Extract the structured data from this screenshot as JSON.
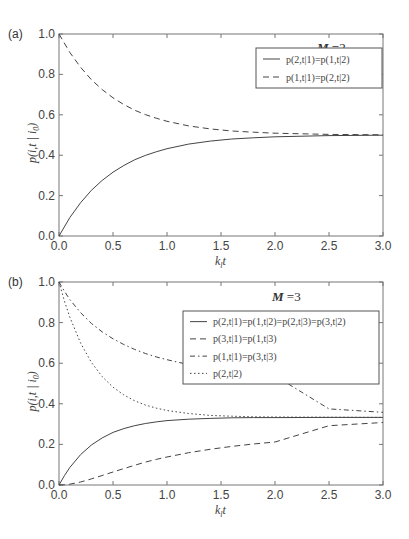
{
  "chart_data": [
    {
      "panel_label": "(a)",
      "type": "line",
      "annotation": "M =2",
      "annotation_bold": "M",
      "annotation_value": " =2",
      "xlabel": "k_l t",
      "ylabel": "p(i,t | i_0)",
      "xlim": [
        0,
        3.0
      ],
      "ylim": [
        0,
        1.0
      ],
      "xticks": [
        "0.0",
        "0.5",
        "1.0",
        "1.5",
        "2.0",
        "2.5",
        "3.0"
      ],
      "yticks": [
        "0.0",
        "0.2",
        "0.4",
        "0.6",
        "0.8",
        "1.0"
      ],
      "grid": false,
      "legend_position": "upper right",
      "x": [
        0,
        0.1,
        0.2,
        0.3,
        0.4,
        0.5,
        0.6,
        0.7,
        0.8,
        0.9,
        1.0,
        1.2,
        1.4,
        1.6,
        1.8,
        2.0,
        2.5,
        3.0
      ],
      "series": [
        {
          "name": "p(2,t|1)=p(1,t|2)",
          "style": "solid",
          "values": [
            0,
            0.091,
            0.165,
            0.226,
            0.275,
            0.316,
            0.349,
            0.377,
            0.399,
            0.417,
            0.432,
            0.455,
            0.47,
            0.48,
            0.486,
            0.491,
            0.497,
            0.499
          ]
        },
        {
          "name": "p(1,t|1)=p(2,t|2)",
          "style": "dashed",
          "values": [
            1,
            0.909,
            0.835,
            0.774,
            0.725,
            0.684,
            0.651,
            0.623,
            0.601,
            0.583,
            0.568,
            0.545,
            0.53,
            0.52,
            0.514,
            0.509,
            0.503,
            0.501
          ]
        }
      ]
    },
    {
      "panel_label": "(b)",
      "type": "line",
      "annotation": "M =3",
      "annotation_bold": "M",
      "annotation_value": " =3",
      "xlabel": "k_l t",
      "ylabel": "p(i,t | i_0)",
      "xlim": [
        0,
        3.0
      ],
      "ylim": [
        0,
        1.0
      ],
      "xticks": [
        "0.0",
        "0.5",
        "1.0",
        "1.5",
        "2.0",
        "2.5",
        "3.0"
      ],
      "yticks": [
        "0.0",
        "0.2",
        "0.4",
        "0.6",
        "0.8",
        "1.0"
      ],
      "grid": false,
      "legend_position": "upper right",
      "x": [
        0,
        0.05,
        0.1,
        0.2,
        0.3,
        0.4,
        0.5,
        0.6,
        0.7,
        0.8,
        0.9,
        1.0,
        1.2,
        1.4,
        1.6,
        1.8,
        2.0,
        2.5,
        3.0
      ],
      "series": [
        {
          "name": "p(2,t|1)=p(1,t|2)=p(2,t|3)=p(3,t|2)",
          "style": "solid",
          "values": [
            0,
            0.046,
            0.086,
            0.15,
            0.197,
            0.232,
            0.259,
            0.278,
            0.292,
            0.303,
            0.311,
            0.317,
            0.324,
            0.328,
            0.331,
            0.332,
            0.332,
            0.333,
            0.333
          ]
        },
        {
          "name": "p(3,t|1)=p(1,t|3)",
          "style": "dashed",
          "values": [
            0,
            0.001,
            0.004,
            0.015,
            0.03,
            0.047,
            0.064,
            0.081,
            0.097,
            0.113,
            0.126,
            0.138,
            0.159,
            0.176,
            0.19,
            0.202,
            0.212,
            0.292,
            0.308
          ]
        },
        {
          "name": "p(1,t|1)=p(3,t|3)",
          "style": "dashdot",
          "values": [
            1,
            0.954,
            0.914,
            0.849,
            0.796,
            0.754,
            0.72,
            0.692,
            0.668,
            0.648,
            0.631,
            0.617,
            0.593,
            0.575,
            0.56,
            0.548,
            0.538,
            0.375,
            0.358
          ]
        },
        {
          "name": "p(2,t|2)",
          "style": "dotted",
          "values": [
            1,
            0.907,
            0.827,
            0.699,
            0.604,
            0.534,
            0.482,
            0.444,
            0.415,
            0.394,
            0.379,
            0.367,
            0.352,
            0.343,
            0.339,
            0.336,
            0.335,
            0.334,
            0.333
          ]
        }
      ]
    }
  ]
}
